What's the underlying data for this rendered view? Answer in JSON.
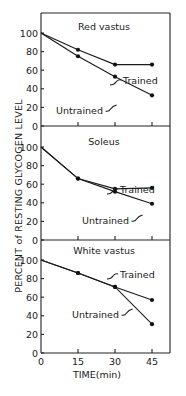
{
  "chart_data": [
    {
      "type": "line",
      "title": "Red vastus",
      "x": [
        0,
        15,
        30,
        45
      ],
      "series": [
        {
          "name": "Trained",
          "values": [
            100,
            82,
            66,
            66
          ]
        },
        {
          "name": "Untrained",
          "values": [
            100,
            75,
            53,
            33
          ]
        }
      ],
      "xlabel": "TIME(min)",
      "ylabel": "PERCENT of RESTING GLYCOGEN LEVEL",
      "xlim": [
        0,
        45
      ],
      "ylim": [
        0,
        100
      ],
      "yticks": [
        0,
        20,
        40,
        60,
        80,
        100
      ]
    },
    {
      "type": "line",
      "title": "Soleus",
      "x": [
        0,
        15,
        30,
        45
      ],
      "series": [
        {
          "name": "Trained",
          "values": [
            100,
            66,
            55,
            56
          ]
        },
        {
          "name": "Untrained",
          "values": [
            100,
            66,
            52,
            39
          ]
        }
      ],
      "xlabel": "TIME(min)",
      "ylabel": "PERCENT of RESTING GLYCOGEN LEVEL",
      "xlim": [
        0,
        45
      ],
      "ylim": [
        0,
        100
      ],
      "yticks": [
        0,
        20,
        40,
        60,
        80,
        100
      ]
    },
    {
      "type": "line",
      "title": "White vastus",
      "x": [
        0,
        15,
        30,
        45
      ],
      "series": [
        {
          "name": "Trained",
          "values": [
            100,
            86,
            71,
            57
          ]
        },
        {
          "name": "Untrained",
          "values": [
            100,
            86,
            71,
            31
          ]
        }
      ],
      "xlabel": "TIME(min)",
      "ylabel": "PERCENT of RESTING GLYCOGEN LEVEL",
      "xlim": [
        0,
        45
      ],
      "ylim": [
        0,
        100
      ],
      "yticks": [
        0,
        20,
        40,
        60,
        80,
        100
      ],
      "xticks": [
        0,
        15,
        30,
        45
      ]
    }
  ],
  "labels": {
    "ylabel": "PERCENT of RESTING GLYCOGEN LEVEL",
    "xlabel": "TIME(min)",
    "panel_titles": [
      "Red vastus",
      "Soleus",
      "White vastus"
    ],
    "trained": "Trained",
    "untrained": "Untrained",
    "yticks": [
      "0",
      "20",
      "40",
      "60",
      "80",
      "100"
    ],
    "xticks": [
      "0",
      "15",
      "30",
      "45"
    ]
  }
}
